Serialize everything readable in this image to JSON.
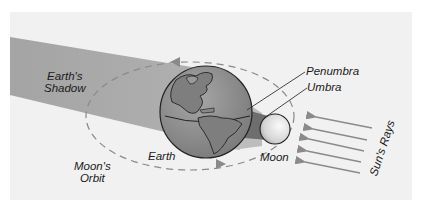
{
  "diagram": {
    "type": "lunar-eclipse",
    "labels": {
      "earths_shadow_line1": "Earth's",
      "earths_shadow_line2": "Shadow",
      "penumbra": "Penumbra",
      "umbra": "Umbra",
      "earth": "Earth",
      "moon": "Moon",
      "moons_orbit_line1": "Moon's",
      "moons_orbit_line2": "Orbit",
      "suns_rays": "Sun's Rays"
    },
    "colors": {
      "background": "#f1f1f1",
      "shadow": "#a9a9a9",
      "penumbra": "#bdbdbd",
      "umbra": "#6e6e6e",
      "earth_ocean": "#8f8f8f",
      "earth_land": "#7a7a7a",
      "moon": "#e6e6e6",
      "orbit": "#8a8a8a",
      "rays": "#8a8a8a"
    },
    "sun_ray_count": 5
  }
}
